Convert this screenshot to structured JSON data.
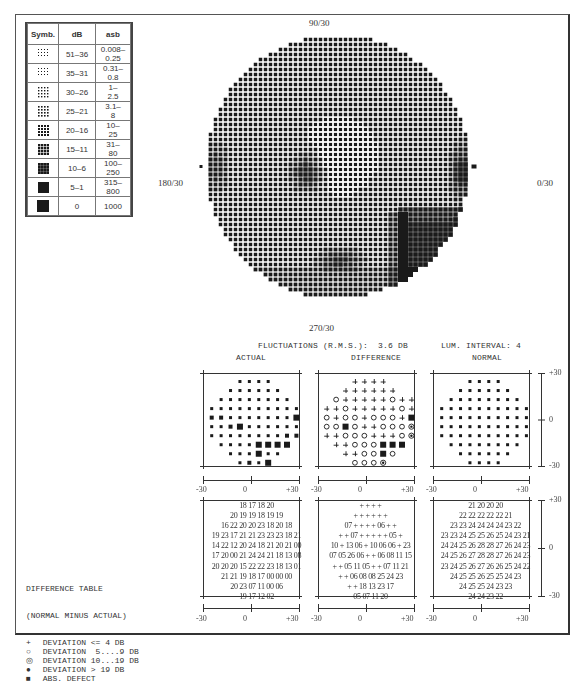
{
  "legend": {
    "headers": [
      "Symb.",
      "dB",
      "asb"
    ],
    "rows": [
      {
        "level": 1,
        "db": "51–36",
        "asb": "0.008–\n0.25"
      },
      {
        "level": 2,
        "db": "35–31",
        "asb": "0.31–\n0.8"
      },
      {
        "level": 3,
        "db": "30–26",
        "asb": "1–\n2.5"
      },
      {
        "level": 4,
        "db": "25–21",
        "asb": "3.1–\n8"
      },
      {
        "level": 5,
        "db": "20–16",
        "asb": "10–\n25"
      },
      {
        "level": 6,
        "db": "15–11",
        "asb": "31–\n80"
      },
      {
        "level": 7,
        "db": "10–6",
        "asb": "100–\n250"
      },
      {
        "level": 8,
        "db": "5–1",
        "asb": "315–\n800"
      },
      {
        "level": 9,
        "db": "0",
        "asb": "1000"
      }
    ]
  },
  "field": {
    "label_top": "90/30",
    "label_bottom": "270/30",
    "label_left": "180/30",
    "label_right": "0/30"
  },
  "summary": {
    "fluctuations": "FLUCTUATIONS (R.M.S.):  3.6 DB",
    "lum_interval": "LUM. INTERVAL: 4"
  },
  "panels": {
    "actual_title": "ACTUAL",
    "difference_title": "DIFFERENCE",
    "normal_title": "NORMAL",
    "x_ticks": [
      "-30",
      "0",
      "+30"
    ],
    "y_ticks": [
      "+30",
      "0",
      "-30"
    ]
  },
  "actual_symbols": [
    "   ssss   ",
    "  ssssss  ",
    " ssssssss ",
    "ssssssssss",
    "mmsssssssL",
    "ssmLssssss",
    "ssssssssmm",
    " ssssLLLL ",
    "  sssLss  ",
    "   smsL   "
  ],
  "difference_symbols": [
    "   ++++   ",
    "  ++++++  ",
    " o+++++o++",
    "++o+++++o+",
    "o+oo+ooo+S",
    "ooSo++ooo@",
    "++ooo+++o@",
    " ++oooSSS ",
    "  ++ooSo  ",
    "   ooo@   "
  ],
  "actual_table": [
    "18 17 18 20",
    "20 19 19 18 19 19",
    "16 22 20 20 23 18 20 18",
    "19 23 17 21 21 23 23 23 18 21",
    "14 22 12 20 24 18 21 20 21 00",
    "17 20 00 21 24 24 21 18 13 08",
    "20 20 20 15 22 22 23 18 13 01",
    "21 21 19 18 17 00 00 00",
    "20 23 07 11 00 06",
    "19 17 12 02"
  ],
  "difference_table": [
    "+ + + +",
    "+ + + + + +",
    "07 + + + + 06 + +",
    "+ + 07 + + + + + 05 +",
    "10 + 13 06 + 10 06 06 + 23",
    "07 05 26 06 + + 06 08 11 15",
    "+ + 05 11 05 + + 07 11 21",
    "+ + 06 08 08 25 24 23",
    "+ + 18 13 23 17",
    "05 07 11 20"
  ],
  "normal_table": [
    "21 20 20 20",
    "22 22 22 22 22 21",
    "23 23 24 24 24 24 23 22",
    "23 23 24 25 25 26 25 24 23 21",
    "24 24 25 26 28 28 27 26 24 23",
    "24 25 26 27 28 28 27 26 24 23",
    "23 24 25 26 27 26 26 25 24 22",
    "24 25 25 26 25 25 24 23",
    "24 25 25 24 23 23",
    "24 24 23 22"
  ],
  "difference_legend": {
    "title": "DIFFERENCE TABLE",
    "subtitle": "(NORMAL MINUS ACTUAL)",
    "items": [
      {
        "icon": "+",
        "label": "DEVIATION <= 4 DB"
      },
      {
        "icon": "o",
        "label": "DEVIATION  5....9 DB"
      },
      {
        "icon": "@",
        "label": "DEVIATION 10...19 DB"
      },
      {
        "icon": "●",
        "label": "DEVIATION > 19 DB"
      },
      {
        "icon": "■",
        "label": "ABS. DEFECT"
      }
    ]
  },
  "colors": {
    "ink": "#1a1a1a",
    "line": "#444444",
    "paper": "#ffffff"
  }
}
